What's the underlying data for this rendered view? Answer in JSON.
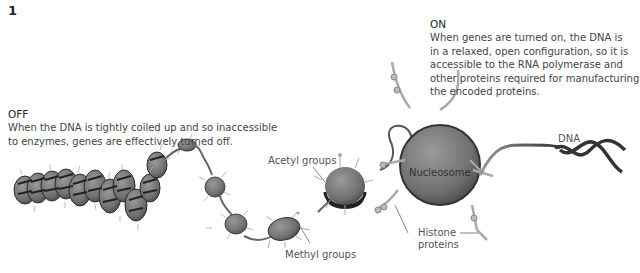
{
  "figure": {
    "number": "1"
  },
  "off_block": {
    "title": "OFF",
    "text_line1": "When the DNA is tightly coiled up and so inaccessible",
    "text_line2": "to enzymes, genes are effectively turned off."
  },
  "on_block": {
    "title": "ON",
    "text_line1": "When genes are turned on, the DNA is",
    "text_line2": "in a relaxed, open configuration, so it is",
    "text_line3": "accessible to the RNA polymerase and",
    "text_line4": "other proteins required for manufacturing",
    "text_line5": "the encoded proteins."
  },
  "labels": {
    "acetyl": "Acetyl groups",
    "methyl": "Methyl groups",
    "nucleosome": "Nucleosome",
    "histone_line1": "Histone",
    "histone_line2": "proteins",
    "dna": "DNA"
  },
  "colors": {
    "nucleosome_fill": "#7a7a7a",
    "nucleosome_dark": "#3a3a3a",
    "dna_strand": "#555555",
    "tail": "#b5b5b5",
    "text": "#444444"
  }
}
